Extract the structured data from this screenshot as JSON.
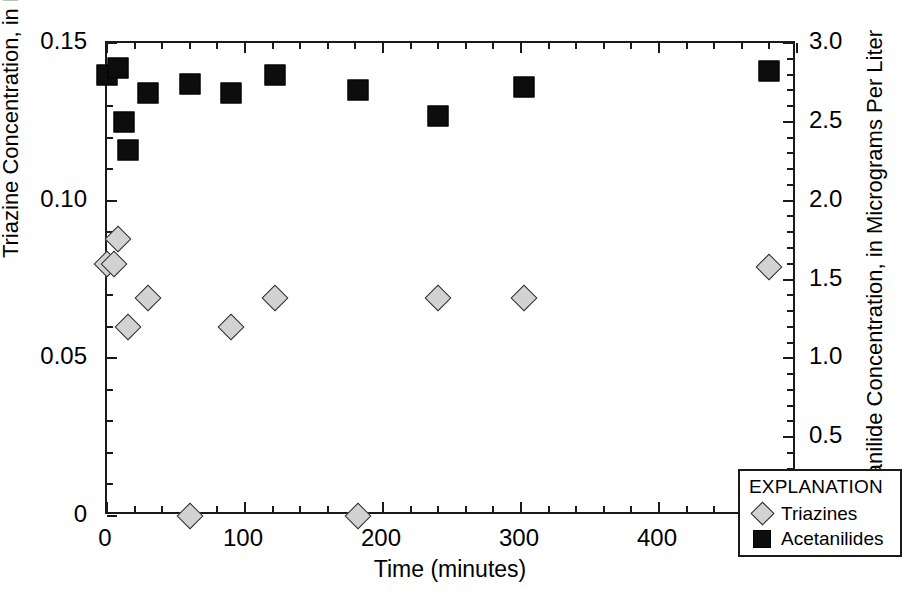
{
  "chart_data": {
    "type": "scatter",
    "title": "",
    "xlabel": "Time (minutes)",
    "ylabel": "Triazine Concentration, in Micrograms Per Liter",
    "y2label": "Acetanilide Concentration, in Micrograms Per Liter",
    "xlim": [
      0,
      500
    ],
    "ylim": [
      0,
      0.15
    ],
    "y2lim": [
      0,
      3.0
    ],
    "grid": false,
    "legend_position": "bottom-right",
    "legend_title": "EXPLANATION",
    "xticks": [
      0,
      100,
      200,
      300,
      400,
      500
    ],
    "xtick_labels": [
      "0",
      "100",
      "200",
      "300",
      "400",
      "500"
    ],
    "x_minor_step": 20,
    "yticks": [
      0,
      0.05,
      0.1,
      0.15
    ],
    "ytick_labels": [
      "0",
      "0.05",
      "0.10",
      "0.15"
    ],
    "y_minor_step": 0.01,
    "y2ticks": [
      0,
      0.5,
      1.0,
      1.5,
      2.0,
      2.5,
      3.0
    ],
    "y2tick_labels": [
      "0",
      "0.5",
      "1.0",
      "1.5",
      "2.0",
      "2.5",
      "3.0"
    ],
    "series": [
      {
        "name": "Triazines",
        "marker": "diamond",
        "color": "#d2d2d2",
        "edge_color": "#2b2b2b",
        "axis": "left",
        "points": [
          {
            "x": 0,
            "y": 0.08
          },
          {
            "x": 5,
            "y": 0.08
          },
          {
            "x": 8,
            "y": 0.088
          },
          {
            "x": 15,
            "y": 0.06
          },
          {
            "x": 30,
            "y": 0.069
          },
          {
            "x": 60,
            "y": 0.0
          },
          {
            "x": 90,
            "y": 0.06
          },
          {
            "x": 122,
            "y": 0.069
          },
          {
            "x": 182,
            "y": 0.0
          },
          {
            "x": 240,
            "y": 0.069
          },
          {
            "x": 302,
            "y": 0.069
          },
          {
            "x": 480,
            "y": 0.079
          }
        ]
      },
      {
        "name": "Acetanilides",
        "marker": "square",
        "color": "#0d0d0d",
        "edge_color": "#000000",
        "axis": "right",
        "points": [
          {
            "x": 0,
            "y": 0.14,
            "y2": 2.8
          },
          {
            "x": 8,
            "y": 0.142,
            "y2": 2.84
          },
          {
            "x": 12,
            "y": 0.125,
            "y2": 2.5
          },
          {
            "x": 15,
            "y": 0.116,
            "y2": 2.32
          },
          {
            "x": 30,
            "y": 0.134,
            "y2": 2.68
          },
          {
            "x": 60,
            "y": 0.137,
            "y2": 2.74
          },
          {
            "x": 90,
            "y": 0.134,
            "y2": 2.68
          },
          {
            "x": 122,
            "y": 0.14,
            "y2": 2.8
          },
          {
            "x": 182,
            "y": 0.135,
            "y2": 2.7
          },
          {
            "x": 240,
            "y": 0.127,
            "y2": 2.54
          },
          {
            "x": 302,
            "y": 0.136,
            "y2": 2.72
          },
          {
            "x": 480,
            "y": 0.141,
            "y2": 2.82
          }
        ]
      }
    ]
  }
}
